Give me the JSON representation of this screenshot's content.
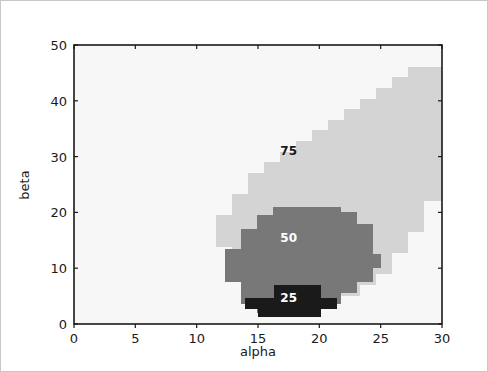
{
  "figure": {
    "background_color": "#ffffff",
    "border_color": "#c8c8c8"
  },
  "chart_data": {
    "type": "heatmap",
    "title": "",
    "xlabel": "alpha",
    "ylabel": "beta",
    "xlim": [
      0,
      30
    ],
    "ylim": [
      0,
      50
    ],
    "xticks": [
      0,
      5,
      10,
      15,
      20,
      25,
      30
    ],
    "yticks": [
      0,
      10,
      20,
      30,
      40,
      50
    ],
    "xtick_labels": [
      "0",
      "5",
      "10",
      "15",
      "20",
      "25",
      "30"
    ],
    "ytick_labels": [
      "0",
      "10",
      "20",
      "30",
      "40",
      "50"
    ],
    "grid": false,
    "legend": "none",
    "colormap": "gray_r",
    "levels": [
      25,
      50,
      75
    ],
    "level_colors": {
      "background": "#f7f7f7",
      "75": "#d4d4d4",
      "50": "#787878",
      "25": "#1a1a1a"
    },
    "contour_labels": [
      {
        "text": "75",
        "x": 17.5,
        "y": 31.0,
        "color": "#1a1a1a"
      },
      {
        "text": "50",
        "x": 17.5,
        "y": 15.5,
        "color": "#ffffff"
      },
      {
        "text": "25",
        "x": 17.5,
        "y": 4.6,
        "color": "#ffffff"
      }
    ],
    "regions": [
      {
        "level": 75,
        "color": "#d4d4d4",
        "description": "Outer light-gray band, crescent sweeping from lower-middle up to the top-right corner",
        "points_xy": [
          [
            30,
            46.0
          ],
          [
            27.2,
            46.0
          ],
          [
            27.2,
            44.2
          ],
          [
            25.9,
            44.2
          ],
          [
            25.9,
            42.3
          ],
          [
            24.6,
            42.3
          ],
          [
            24.6,
            40.4
          ],
          [
            23.3,
            40.4
          ],
          [
            23.3,
            38.5
          ],
          [
            22.0,
            38.5
          ],
          [
            22.0,
            36.6
          ],
          [
            20.7,
            36.6
          ],
          [
            20.7,
            34.7
          ],
          [
            19.4,
            34.7
          ],
          [
            19.4,
            32.8
          ],
          [
            18.1,
            32.8
          ],
          [
            18.1,
            30.9
          ],
          [
            16.8,
            30.9
          ],
          [
            16.8,
            29.0
          ],
          [
            15.5,
            29.0
          ],
          [
            15.5,
            27.1
          ],
          [
            14.2,
            27.1
          ],
          [
            14.2,
            23.3
          ],
          [
            12.9,
            23.3
          ],
          [
            12.9,
            19.5
          ],
          [
            11.6,
            19.5
          ],
          [
            11.6,
            13.8
          ],
          [
            12.9,
            13.8
          ],
          [
            12.9,
            8.0
          ],
          [
            14.2,
            8.0
          ],
          [
            14.2,
            5.1
          ],
          [
            15.5,
            5.1
          ],
          [
            15.5,
            3.2
          ],
          [
            20.7,
            3.2
          ],
          [
            20.7,
            5.1
          ],
          [
            23.3,
            5.1
          ],
          [
            23.3,
            7.0
          ],
          [
            24.6,
            7.0
          ],
          [
            24.6,
            8.9
          ],
          [
            25.9,
            8.9
          ],
          [
            25.9,
            12.7
          ],
          [
            27.2,
            12.7
          ],
          [
            27.2,
            16.5
          ],
          [
            28.5,
            16.5
          ],
          [
            28.5,
            22.0
          ],
          [
            30,
            22.0
          ]
        ]
      },
      {
        "level": 50,
        "color": "#787878",
        "description": "Middle medium-gray ellipse centred near alpha 19, beta 12",
        "points_xy": [
          [
            16.2,
            21.0
          ],
          [
            21.8,
            21.0
          ],
          [
            21.8,
            20.0
          ],
          [
            23.1,
            20.0
          ],
          [
            23.1,
            18.0
          ],
          [
            24.4,
            18.0
          ],
          [
            24.4,
            12.5
          ],
          [
            25.0,
            12.5
          ],
          [
            25.0,
            10.0
          ],
          [
            24.4,
            10.0
          ],
          [
            24.4,
            7.5
          ],
          [
            23.1,
            7.5
          ],
          [
            23.1,
            5.5
          ],
          [
            21.8,
            5.5
          ],
          [
            21.8,
            3.5
          ],
          [
            16.2,
            3.5
          ],
          [
            16.2,
            2.0
          ],
          [
            14.9,
            2.0
          ],
          [
            14.9,
            3.5
          ],
          [
            13.6,
            3.5
          ],
          [
            13.6,
            7.5
          ],
          [
            12.3,
            7.5
          ],
          [
            12.3,
            13.5
          ],
          [
            13.6,
            13.5
          ],
          [
            13.6,
            17.0
          ],
          [
            14.9,
            17.0
          ],
          [
            14.9,
            19.5
          ],
          [
            16.2,
            19.5
          ]
        ]
      },
      {
        "level": 25,
        "color": "#1a1a1a",
        "description": "Inner black blob near alpha 18, beta 4",
        "points_xy": [
          [
            16.3,
            7.0
          ],
          [
            20.1,
            7.0
          ],
          [
            20.1,
            4.7
          ],
          [
            21.4,
            4.7
          ],
          [
            21.4,
            2.7
          ],
          [
            20.1,
            2.7
          ],
          [
            20.1,
            1.3
          ],
          [
            15.0,
            1.3
          ],
          [
            15.0,
            2.7
          ],
          [
            13.9,
            2.7
          ],
          [
            13.9,
            4.7
          ],
          [
            16.3,
            4.7
          ]
        ]
      }
    ]
  }
}
